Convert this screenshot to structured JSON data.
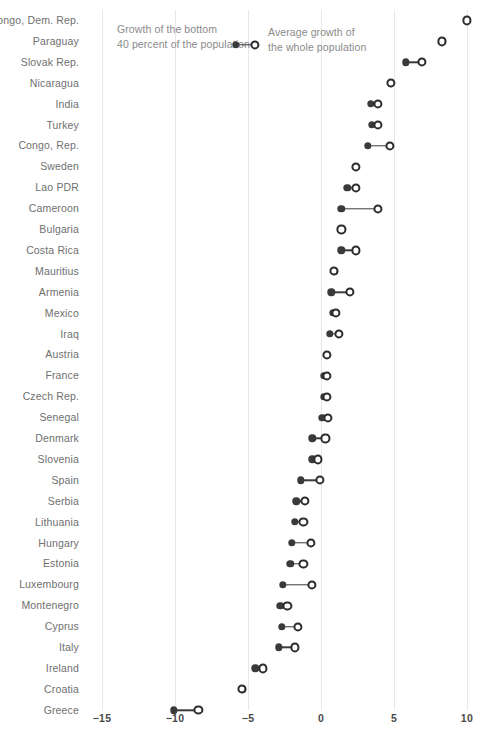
{
  "chart_data": {
    "type": "scatter",
    "subtype": "dumbbell",
    "title": "",
    "xlabel": "",
    "ylabel": "",
    "xlim": [
      -15,
      10
    ],
    "xticks": [
      -15,
      -10,
      -5,
      0,
      5,
      10
    ],
    "xtick_labels": [
      "−15",
      "−10",
      "−5",
      "0",
      "5",
      "10"
    ],
    "grid": "vertical",
    "legend_position": "top-left-inline",
    "series": [
      {
        "name": "Growth of the bottom 40 percent of the population",
        "marker": "filled-circle",
        "color": "#3a3a3a"
      },
      {
        "name": "Average growth of the whole population",
        "marker": "hollow-circle",
        "color": "#2c2c2c"
      }
    ],
    "categories": [
      "Congo, Dem. Rep.",
      "Paraguay",
      "Slovak Rep.",
      "Nicaragua",
      "India",
      "Turkey",
      "Congo, Rep.",
      "Sweden",
      "Lao PDR",
      "Cameroon",
      "Bulgaria",
      "Costa Rica",
      "Mauritius",
      "Armenia",
      "Mexico",
      "Iraq",
      "Austria",
      "France",
      "Czech Rep.",
      "Senegal",
      "Denmark",
      "Slovenia",
      "Spain",
      "Serbia",
      "Lithuania",
      "Hungary",
      "Estonia",
      "Luxembourg",
      "Montenegro",
      "Cyprus",
      "Italy",
      "Ireland",
      "Croatia",
      "Greece"
    ],
    "rows": [
      {
        "label": "Congo, Dem. Rep.",
        "bottom40": 10.0,
        "average": 10.0
      },
      {
        "label": "Paraguay",
        "bottom40": 8.3,
        "average": 8.3
      },
      {
        "label": "Slovak Rep.",
        "bottom40": 5.8,
        "average": 6.9
      },
      {
        "label": "Nicaragua",
        "bottom40": 4.8,
        "average": 4.8
      },
      {
        "label": "India",
        "bottom40": 3.4,
        "average": 3.9
      },
      {
        "label": "Turkey",
        "bottom40": 3.5,
        "average": 3.9
      },
      {
        "label": "Congo, Rep.",
        "bottom40": 3.2,
        "average": 4.7
      },
      {
        "label": "Sweden",
        "bottom40": 2.4,
        "average": 2.4
      },
      {
        "label": "Lao PDR",
        "bottom40": 1.8,
        "average": 2.4
      },
      {
        "label": "Cameroon",
        "bottom40": 1.4,
        "average": 3.9
      },
      {
        "label": "Bulgaria",
        "bottom40": 1.4,
        "average": 1.4
      },
      {
        "label": "Costa Rica",
        "bottom40": 1.4,
        "average": 2.4
      },
      {
        "label": "Mauritius",
        "bottom40": 0.9,
        "average": 0.9
      },
      {
        "label": "Armenia",
        "bottom40": 0.7,
        "average": 2.0
      },
      {
        "label": "Mexico",
        "bottom40": 0.8,
        "average": 1.0
      },
      {
        "label": "Iraq",
        "bottom40": 0.6,
        "average": 1.2
      },
      {
        "label": "Austria",
        "bottom40": 0.4,
        "average": 0.4
      },
      {
        "label": "France",
        "bottom40": 0.2,
        "average": 0.4
      },
      {
        "label": "Czech Rep.",
        "bottom40": 0.2,
        "average": 0.4
      },
      {
        "label": "Senegal",
        "bottom40": 0.1,
        "average": 0.5
      },
      {
        "label": "Denmark",
        "bottom40": -0.6,
        "average": 0.3
      },
      {
        "label": "Slovenia",
        "bottom40": -0.6,
        "average": -0.2
      },
      {
        "label": "Spain",
        "bottom40": -1.4,
        "average": -0.1
      },
      {
        "label": "Serbia",
        "bottom40": -1.7,
        "average": -1.1
      },
      {
        "label": "Lithuania",
        "bottom40": -1.8,
        "average": -1.2
      },
      {
        "label": "Hungary",
        "bottom40": -2.0,
        "average": -0.7
      },
      {
        "label": "Estonia",
        "bottom40": -2.1,
        "average": -1.2
      },
      {
        "label": "Luxembourg",
        "bottom40": -2.6,
        "average": -0.6
      },
      {
        "label": "Montenegro",
        "bottom40": -2.8,
        "average": -2.3
      },
      {
        "label": "Cyprus",
        "bottom40": -2.7,
        "average": -1.6
      },
      {
        "label": "Italy",
        "bottom40": -2.9,
        "average": -1.8
      },
      {
        "label": "Ireland",
        "bottom40": -4.5,
        "average": -4.0
      },
      {
        "label": "Croatia",
        "bottom40": -5.4,
        "average": -5.4
      },
      {
        "label": "Greece",
        "bottom40": -10.1,
        "average": -8.4
      }
    ],
    "annotations": [
      {
        "id": "bottom40",
        "text": "Growth of the bottom\n40 percent of the population"
      },
      {
        "id": "average",
        "text": "Average growth of\nthe whole population"
      }
    ]
  },
  "colors": {
    "filled_marker": "#3a3a3a",
    "hollow_marker": "#2c2c2c",
    "gridline": "#e8e8e8",
    "label_text": "#6f6f6f",
    "tick_text": "#4a4a4a",
    "annotation_text": "#8a8a8a",
    "background": "#ffffff"
  }
}
